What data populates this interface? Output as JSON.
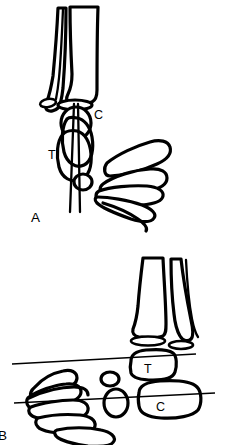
{
  "figure": {
    "type": "line-drawing",
    "background_color": "#ffffff",
    "line_color": "#000000",
    "width": 246,
    "height": 445,
    "panels": [
      {
        "id": "A",
        "label": "A",
        "label_position": {
          "x": 34,
          "y": 219
        },
        "view": "anteroposterior",
        "bounds": {
          "x": 0,
          "y": 0,
          "width": 246,
          "height": 228
        },
        "annotations": [
          {
            "id": "panelA-C",
            "text": "C",
            "x": 94,
            "y": 119
          },
          {
            "id": "panelA-T",
            "text": "T",
            "x": 52,
            "y": 159
          }
        ],
        "reference_lines": []
      },
      {
        "id": "B",
        "label": "B",
        "label_position": {
          "x": 1,
          "y": 438
        },
        "view": "lateral",
        "bounds": {
          "x": 0,
          "y": 228,
          "width": 246,
          "height": 217
        },
        "annotations": [
          {
            "id": "panelB-T",
            "text": "T",
            "x": 148,
            "y": 369
          },
          {
            "id": "panelB-C",
            "text": "C",
            "x": 160,
            "y": 407
          }
        ],
        "reference_lines": [
          {
            "id": "reference-line-upper",
            "x1": 12,
            "y1": 364,
            "x2": 196,
            "y2": 354
          },
          {
            "id": "reference-line-lower",
            "x1": 14,
            "y1": 403,
            "x2": 215,
            "y2": 393
          }
        ]
      }
    ]
  }
}
